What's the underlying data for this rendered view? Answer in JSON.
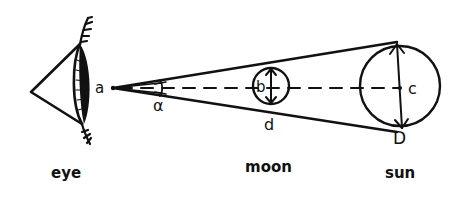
{
  "diagram": {
    "type": "geometric-optics-sketch",
    "ink_color": "#111111",
    "background": "#ffffff",
    "labels": {
      "observer_point": "a",
      "angle": "α",
      "moon_center": "b",
      "moon_diameter": "d",
      "sun_center": "c",
      "sun_diameter": "D"
    },
    "captions": {
      "eye": "eye",
      "moon": "moon",
      "sun": "sun"
    },
    "objects": [
      {
        "name": "eye",
        "icon": "eye-icon"
      },
      {
        "name": "moon",
        "shape": "small circle",
        "diameter_label": "d",
        "center_label": "b"
      },
      {
        "name": "sun",
        "shape": "large circle",
        "diameter_label": "D",
        "center_label": "c"
      }
    ],
    "relations": [
      "Lines of sight from point a tangent to both moon and sun form angle α",
      "Dashed center line passes through a, b, c"
    ]
  }
}
